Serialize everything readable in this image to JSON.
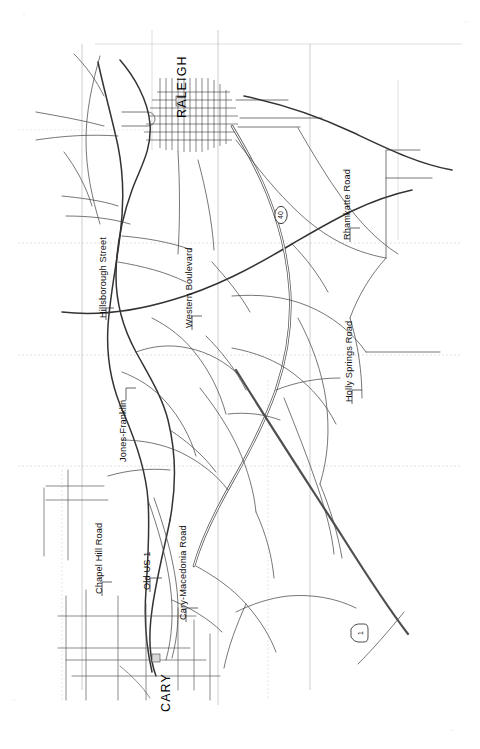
{
  "document": {
    "kind": "scanned-road-map",
    "orientation_note": "landscape map rotated 90 degrees; labels read bottom-to-top",
    "background_color": "#ffffff",
    "ink_color": "#333333",
    "grid_color": "#c4c4c4"
  },
  "cities": [
    {
      "id": "raleigh",
      "name": "RALEIGH"
    },
    {
      "id": "cary",
      "name": "CARY"
    }
  ],
  "street_labels": [
    {
      "id": "hillsborough",
      "name": "Hillsborough Street"
    },
    {
      "id": "western",
      "name": "Western Boulevard"
    },
    {
      "id": "rhamkatte",
      "name": "Rhamkatte Road"
    },
    {
      "id": "holly-springs",
      "name": "Holly Springs Road"
    },
    {
      "id": "jones-franklin",
      "name": "Jones-Franklin"
    },
    {
      "id": "chapel-hill",
      "name": "Chapel Hill Road"
    },
    {
      "id": "old-us-1",
      "name": "Old US 1"
    },
    {
      "id": "cary-macedonia",
      "name": "Cary-Macedonia Road"
    }
  ],
  "route_shields": [
    {
      "id": "i40",
      "number": "40",
      "shape": "interstate-ellipse"
    },
    {
      "id": "us1",
      "number": "1",
      "shape": "us-square"
    }
  ]
}
